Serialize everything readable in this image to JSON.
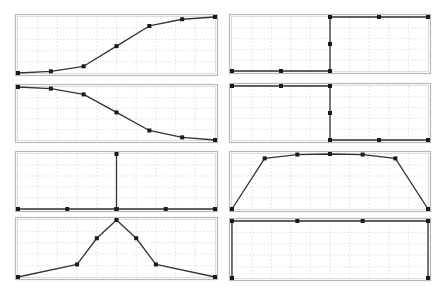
{
  "layout": {
    "panels": [
      {
        "id": "p1",
        "x": 15,
        "y": 14,
        "w": 203,
        "h": 62
      },
      {
        "id": "p2",
        "x": 229,
        "y": 14,
        "w": 202,
        "h": 60
      },
      {
        "id": "p3",
        "x": 15,
        "y": 84,
        "w": 203,
        "h": 59
      },
      {
        "id": "p4",
        "x": 229,
        "y": 83,
        "w": 202,
        "h": 60
      },
      {
        "id": "p5",
        "x": 15,
        "y": 151,
        "w": 203,
        "h": 61
      },
      {
        "id": "p6",
        "x": 229,
        "y": 151,
        "w": 202,
        "h": 61
      },
      {
        "id": "p7",
        "x": 15,
        "y": 217,
        "w": 203,
        "h": 63
      },
      {
        "id": "p8",
        "x": 229,
        "y": 218,
        "w": 202,
        "h": 63
      }
    ],
    "grid": {
      "vdiv": 10,
      "hdiv": 5
    },
    "colors": {
      "line": "#333333",
      "marker": "#1a1a1a",
      "grid": "#d4d4d4",
      "frame": "#b8b8b8"
    }
  },
  "chart_data": [
    {
      "type": "line",
      "title": "",
      "description": "rising sigmoid",
      "x": [
        0,
        1,
        2,
        3,
        4,
        5,
        6
      ],
      "y": [
        0.0,
        0.03,
        0.12,
        0.48,
        0.84,
        0.96,
        1.0
      ],
      "xlim": [
        0,
        6
      ],
      "ylim": [
        0,
        1
      ],
      "grid": true
    },
    {
      "type": "line",
      "title": "",
      "description": "step up at midpoint",
      "x": [
        0,
        0.5,
        1,
        1,
        1,
        1.5,
        2
      ],
      "y": [
        0,
        0,
        0,
        0.5,
        1,
        1,
        1
      ],
      "xlim": [
        0,
        2
      ],
      "ylim": [
        0,
        1
      ],
      "grid": true
    },
    {
      "type": "line",
      "title": "",
      "description": "falling sigmoid",
      "x": [
        0,
        1,
        2,
        3,
        4,
        5,
        6
      ],
      "y": [
        1.0,
        0.97,
        0.86,
        0.52,
        0.18,
        0.05,
        0.0
      ],
      "xlim": [
        0,
        6
      ],
      "ylim": [
        0,
        1
      ],
      "grid": true
    },
    {
      "type": "line",
      "title": "",
      "description": "step down at midpoint",
      "x": [
        0,
        0.5,
        1,
        1,
        1,
        1.5,
        2
      ],
      "y": [
        1,
        1,
        1,
        0.5,
        0,
        0,
        0
      ],
      "xlim": [
        0,
        2
      ],
      "ylim": [
        0,
        1
      ],
      "grid": true
    },
    {
      "type": "line",
      "title": "",
      "description": "impulse at center",
      "x": [
        0,
        1,
        2,
        2,
        2,
        3,
        4
      ],
      "y": [
        0,
        0,
        0,
        1,
        0,
        0,
        0
      ],
      "xlim": [
        0,
        4
      ],
      "ylim": [
        0,
        1
      ],
      "grid": true
    },
    {
      "type": "line",
      "title": "",
      "description": "trapezoid plateau",
      "x": [
        0,
        1,
        2,
        3,
        4,
        5,
        6
      ],
      "y": [
        0.0,
        0.92,
        0.99,
        1.0,
        0.99,
        0.92,
        0.0
      ],
      "xlim": [
        0,
        6
      ],
      "ylim": [
        0,
        1
      ],
      "grid": true
    },
    {
      "type": "line",
      "title": "",
      "description": "gaussian peak",
      "x": [
        0,
        3,
        4,
        5,
        6,
        7,
        10
      ],
      "y": [
        0.0,
        0.22,
        0.68,
        1.0,
        0.68,
        0.22,
        0.0
      ],
      "xlim": [
        0,
        10
      ],
      "ylim": [
        0,
        1
      ],
      "grid": true
    },
    {
      "type": "line",
      "title": "",
      "description": "rectangle (constant high with vertical edges)",
      "x": [
        0,
        0,
        1,
        2,
        3,
        3
      ],
      "y": [
        0,
        1,
        1,
        1,
        1,
        0
      ],
      "xlim": [
        0,
        3
      ],
      "ylim": [
        0,
        1
      ],
      "grid": true
    }
  ]
}
